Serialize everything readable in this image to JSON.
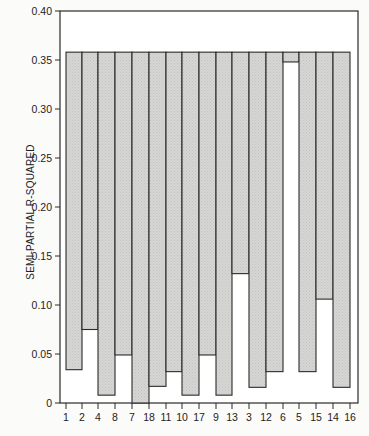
{
  "chart_data": {
    "type": "bar",
    "subtype": "floating-range",
    "title": "",
    "xlabel": "",
    "ylabel": "SEMI-PARTIAL R-SQUARED",
    "ylim": [
      0,
      0.4
    ],
    "yticks": [
      "0",
      "0.05",
      "0.10",
      "0.15",
      "0.20",
      "0.25",
      "0.30",
      "0.35",
      "0.40"
    ],
    "x_tick_labels": [
      "1",
      "2",
      "4",
      "8",
      "7",
      "18",
      "11",
      "10",
      "17",
      "9",
      "13",
      "3",
      "12",
      "6",
      "5",
      "15",
      "14",
      "16"
    ],
    "bar_top": 0.358,
    "bars": [
      {
        "from": "1",
        "to": "2",
        "bottom": 0.034
      },
      {
        "from": "2",
        "to": "4",
        "bottom": 0.075
      },
      {
        "from": "4",
        "to": "8",
        "bottom": 0.008
      },
      {
        "from": "8",
        "to": "7",
        "bottom": 0.049
      },
      {
        "from": "7",
        "to": "18",
        "bottom": 0.0
      },
      {
        "from": "18",
        "to": "11",
        "bottom": 0.017
      },
      {
        "from": "11",
        "to": "10",
        "bottom": 0.032
      },
      {
        "from": "10",
        "to": "17",
        "bottom": 0.008
      },
      {
        "from": "17",
        "to": "9",
        "bottom": 0.049
      },
      {
        "from": "9",
        "to": "13",
        "bottom": 0.008
      },
      {
        "from": "13",
        "to": "3",
        "bottom": 0.132
      },
      {
        "from": "3",
        "to": "12",
        "bottom": 0.016
      },
      {
        "from": "12",
        "to": "6",
        "bottom": 0.032
      },
      {
        "from": "6",
        "to": "5",
        "bottom": 0.348
      },
      {
        "from": "5",
        "to": "15",
        "bottom": 0.032
      },
      {
        "from": "15",
        "to": "14",
        "bottom": 0.106
      },
      {
        "from": "14",
        "to": "16",
        "bottom": 0.016
      }
    ],
    "grid": false,
    "legend": null,
    "colors": {
      "bar_fill": "#d4d4d2",
      "bar_edge": "#2a2a2a",
      "axis": "#2a2a2a"
    }
  }
}
